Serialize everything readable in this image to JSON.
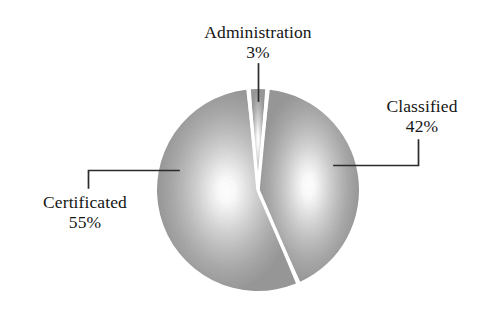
{
  "chart_data": {
    "type": "pie",
    "title": "",
    "subtitle": "",
    "xlabel": "",
    "ylabel": "",
    "grid": false,
    "legend_position": "none",
    "label_format": "name + percent",
    "total_percent": 100,
    "categories": [
      "Administration",
      "Classified",
      "Certificated"
    ],
    "values": [
      3,
      42,
      55
    ],
    "slices": [
      {
        "name": "Administration",
        "value": 3,
        "value_label": "3%",
        "label_position": "top",
        "leader_line": "vertical",
        "fill": "#9e9e9e"
      },
      {
        "name": "Classified",
        "value": 42,
        "value_label": "42%",
        "label_position": "right",
        "leader_line": "elbow-right",
        "fill": "#9e9e9e"
      },
      {
        "name": "Certificated",
        "value": 55,
        "value_label": "55%",
        "label_position": "left",
        "leader_line": "elbow-left",
        "fill": "#9e9e9e"
      }
    ],
    "annotations": []
  },
  "chart": {
    "geometry": {
      "center_x": 258,
      "center_y": 190,
      "radius": 101
    }
  },
  "colors": {
    "background": "#ffffff",
    "slice_edge_gray": "#9a9a9a",
    "slice_center_gray": "#ffffff",
    "separator": "#ffffff",
    "leader_line": "#2b2b2b",
    "text": "#151515"
  },
  "labels": {
    "administration": {
      "name": "Administration",
      "value": "3%"
    },
    "classified": {
      "name": "Classified",
      "value": "42%"
    },
    "certificated": {
      "name": "Certificated",
      "value": "55%"
    }
  }
}
